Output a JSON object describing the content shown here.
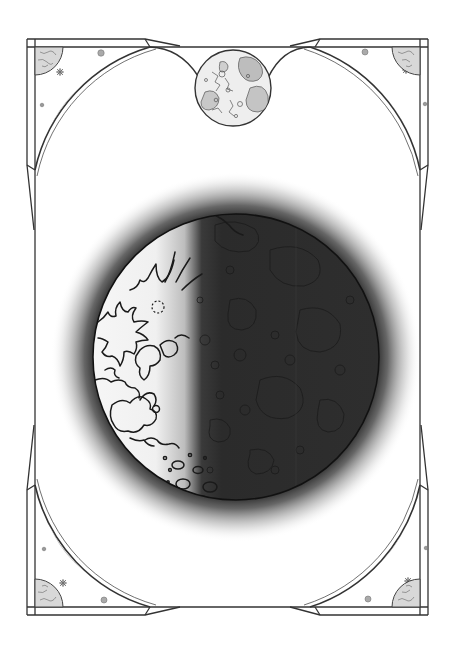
{
  "artwork": {
    "title": "Moon phase coloring page",
    "subject": "waxing crescent moon with lunar maria outlines",
    "frame": "ornate celestial frame with corner moons, stars and orbit arcs",
    "icons": [
      "frame-border",
      "corner-moon-icon",
      "star-icon",
      "planet-dot-icon",
      "top-full-moon-icon",
      "main-moon"
    ]
  },
  "colors": {
    "background": "#ffffff",
    "line": "#333333",
    "light_line": "#bbbbbb",
    "moon_dark": "#2b2b2b",
    "moon_light": "#f4f4f4",
    "halo": "#1a1a1a",
    "maria_fill": "#cfcfcf"
  },
  "geometry": {
    "main_moon": {
      "cx": 236,
      "cy": 357,
      "r": 143
    },
    "top_moon": {
      "cx": 233,
      "cy": 88,
      "r": 38
    },
    "frame": {
      "outer_left": 27,
      "outer_right": 428,
      "outer_top": 39,
      "outer_bottom": 615
    }
  }
}
